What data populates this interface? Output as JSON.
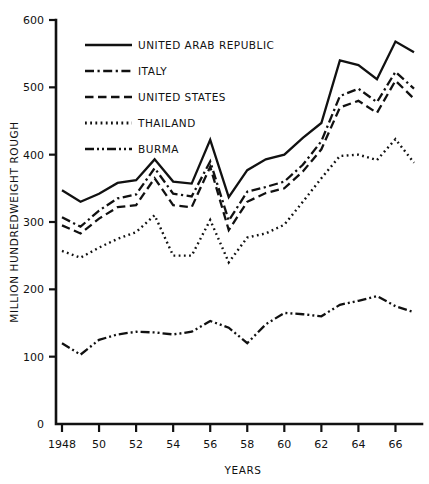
{
  "chart_data": {
    "type": "line",
    "title": "",
    "xlabel": "YEARS",
    "ylabel": "MILLION HUNDREDWEIGHT ROUGH",
    "xlim": [
      1948,
      1967
    ],
    "ylim": [
      0,
      600
    ],
    "grid": false,
    "legend_position": "top-left inside axes",
    "x": [
      1948,
      1949,
      1950,
      1951,
      1952,
      1953,
      1954,
      1955,
      1956,
      1957,
      1958,
      1959,
      1960,
      1961,
      1962,
      1963,
      1964,
      1965,
      1966,
      1967
    ],
    "x_tick_labels": [
      "1948",
      "50",
      "52",
      "54",
      "56",
      "58",
      "60",
      "62",
      "64",
      "66"
    ],
    "x_ticks": [
      1948,
      1950,
      1952,
      1954,
      1956,
      1958,
      1960,
      1962,
      1964,
      1966
    ],
    "y_ticks": [
      0,
      100,
      200,
      300,
      400,
      500,
      600
    ],
    "y_tick_labels": [
      "0",
      "100",
      "200",
      "300",
      "400",
      "500",
      "600"
    ],
    "series": [
      {
        "name": "UNITED ARAB REPUBLIC",
        "style": "solid",
        "values": [
          347,
          330,
          342,
          358,
          362,
          393,
          360,
          357,
          422,
          337,
          377,
          393,
          400,
          425,
          447,
          540,
          533,
          512,
          568,
          552
        ]
      },
      {
        "name": "ITALY",
        "style": "dash-dot",
        "values": [
          307,
          293,
          317,
          335,
          341,
          380,
          342,
          338,
          390,
          302,
          345,
          352,
          360,
          385,
          420,
          487,
          498,
          478,
          523,
          498
        ]
      },
      {
        "name": "UNITED STATES",
        "style": "dashed",
        "values": [
          295,
          283,
          305,
          322,
          325,
          365,
          325,
          322,
          382,
          288,
          330,
          343,
          350,
          375,
          408,
          470,
          480,
          462,
          510,
          483
        ]
      },
      {
        "name": "THAILAND",
        "style": "dotted",
        "values": [
          257,
          247,
          262,
          275,
          285,
          310,
          250,
          250,
          303,
          240,
          277,
          283,
          296,
          330,
          365,
          398,
          400,
          392,
          423,
          388
        ]
      },
      {
        "name": "BURMA",
        "style": "dash-dot-dot",
        "values": [
          120,
          103,
          125,
          133,
          137,
          136,
          133,
          137,
          153,
          143,
          120,
          148,
          165,
          163,
          160,
          177,
          183,
          190,
          175,
          166
        ]
      }
    ],
    "legend": [
      {
        "label": "UNITED ARAB REPUBLIC",
        "style": "solid"
      },
      {
        "label": "ITALY",
        "style": "dash-dot"
      },
      {
        "label": "UNITED STATES",
        "style": "dashed"
      },
      {
        "label": "THAILAND",
        "style": "dotted"
      },
      {
        "label": "BURMA",
        "style": "dash-dot-dot"
      }
    ]
  }
}
